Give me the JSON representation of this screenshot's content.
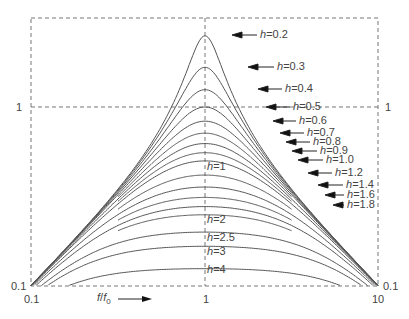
{
  "chart_data": {
    "type": "line",
    "title": "",
    "xlabel": "f/f0",
    "ylabel": "",
    "xscale": "log",
    "yscale": "log",
    "xlim": [
      0.1,
      10
    ],
    "ylim": [
      0.1,
      3
    ],
    "x_ticks": [
      "0.1",
      "1",
      "10"
    ],
    "y_ticks_left": [
      "0.1",
      "1"
    ],
    "y_ticks_right": [
      "0.1",
      "1"
    ],
    "grid": "dashed lines at x=1 and y=1, dashed frame",
    "legend": "none; curves labeled by damping ratio h",
    "function": "y = r / sqrt((1 - r^2)^2 + (2 h r)^2), r = f/f0 (peak 1/(2h) at r=1)",
    "series": [
      {
        "name": "h=0.2",
        "h": 0.2,
        "peak": 2.5
      },
      {
        "name": "h=0.3",
        "h": 0.3,
        "peak": 1.667
      },
      {
        "name": "h=0.4",
        "h": 0.4,
        "peak": 1.25
      },
      {
        "name": "h=0.5",
        "h": 0.5,
        "peak": 1.0
      },
      {
        "name": "h=0.6",
        "h": 0.6,
        "peak": 0.833
      },
      {
        "name": "h=0.7",
        "h": 0.7,
        "peak": 0.714
      },
      {
        "name": "h=0.8",
        "h": 0.8,
        "peak": 0.625
      },
      {
        "name": "h=0.9",
        "h": 0.9,
        "peak": 0.556
      },
      {
        "name": "h=1.0",
        "h": 1.0,
        "peak": 0.5
      },
      {
        "name": "h=1.2",
        "h": 1.2,
        "peak": 0.417
      },
      {
        "name": "h=1.4",
        "h": 1.4,
        "peak": 0.357
      },
      {
        "name": "h=1.6",
        "h": 1.6,
        "peak": 0.3125
      },
      {
        "name": "h=1.8",
        "h": 1.8,
        "peak": 0.278
      },
      {
        "name": "h=2",
        "h": 2.0,
        "peak": 0.25
      },
      {
        "name": "h=2.5",
        "h": 2.5,
        "peak": 0.2
      },
      {
        "name": "h=3",
        "h": 3.0,
        "peak": 0.167
      },
      {
        "name": "h=4",
        "h": 4.0,
        "peak": 0.125
      }
    ]
  },
  "axes": {
    "x_tick_left": "0.1",
    "x_tick_mid": "1",
    "x_tick_right": "10",
    "y_tick_left_bottom": "0.1",
    "y_tick_left_one": "1",
    "y_tick_right_bottom": "0.1",
    "y_tick_right_one": "1",
    "xlabel_f": "f",
    "xlabel_slash": "/",
    "xlabel_f0": "f",
    "xlabel_sub": "0"
  },
  "arrow_labels": [
    {
      "text": "=0.2",
      "ax": 232,
      "tx": 260,
      "y": 35
    },
    {
      "text": "=0.3",
      "ax": 248,
      "tx": 277,
      "y": 67
    },
    {
      "text": "=0.4",
      "ax": 258,
      "tx": 285,
      "y": 89
    },
    {
      "text": "=0.5",
      "ax": 266,
      "tx": 293,
      "y": 107
    },
    {
      "text": "=0.6",
      "ax": 273,
      "tx": 299,
      "y": 121
    },
    {
      "text": "=0.7",
      "ax": 280,
      "tx": 307,
      "y": 133
    },
    {
      "text": "=0.8",
      "ax": 286,
      "tx": 313,
      "y": 142
    },
    {
      "text": "=0.9",
      "ax": 292,
      "tx": 320,
      "y": 151
    },
    {
      "text": "=1.0",
      "ax": 298,
      "tx": 326,
      "y": 160
    },
    {
      "text": "=1.2",
      "ax": 308,
      "tx": 335,
      "y": 173
    },
    {
      "text": "=1.4",
      "ax": 318,
      "tx": 346,
      "y": 185
    },
    {
      "text": "=1.6",
      "ax": 325,
      "tx": 347,
      "y": 195
    },
    {
      "text": "=1.8",
      "ax": 333,
      "tx": 347,
      "y": 205
    }
  ],
  "inline_labels": [
    {
      "text": "=1",
      "y": 167
    },
    {
      "text": "=2",
      "y": 220
    },
    {
      "text": "=2.5",
      "y": 238
    },
    {
      "text": "=3",
      "y": 252
    },
    {
      "text": "=4",
      "y": 270
    }
  ],
  "h_symbol": "h"
}
